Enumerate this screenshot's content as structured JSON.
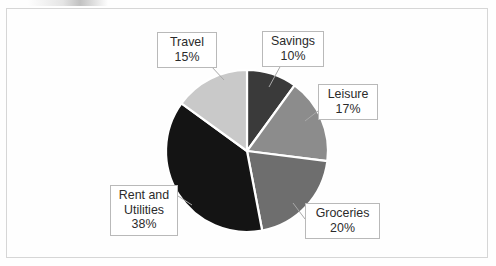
{
  "document": {
    "artifact_label": "scan-artifact"
  },
  "chart_data": {
    "type": "pie",
    "title": "",
    "subtitle": "",
    "xlabel": "",
    "ylabel": "",
    "legend_position": "none",
    "grid": false,
    "units": "percent",
    "label_format": "category + percentage",
    "start_angle_deg": -90,
    "direction": "clockwise",
    "categories": [
      "Savings",
      "Leisure",
      "Groceries",
      "Rent and Utilities",
      "Travel"
    ],
    "values": [
      10,
      17,
      20,
      38,
      15
    ],
    "total": 100,
    "slices": [
      {
        "name": "Savings",
        "label_line1": "Savings",
        "label_line2": "10%",
        "value": 10,
        "angle_deg": 36,
        "start_deg": -90,
        "end_deg": -54,
        "color": "#3a3a3a"
      },
      {
        "name": "Leisure",
        "label_line1": "Leisure",
        "label_line2": "17%",
        "value": 17,
        "angle_deg": 61.2,
        "start_deg": -54,
        "end_deg": 7.2,
        "color": "#8c8c8c"
      },
      {
        "name": "Groceries",
        "label_line1": "Groceries",
        "label_line2": "20%",
        "value": 20,
        "angle_deg": 72,
        "start_deg": 7.2,
        "end_deg": 79.2,
        "color": "#6e6e6e"
      },
      {
        "name": "Rent and Utilities",
        "label_line1": "Rent and",
        "label_line2": "Utilities",
        "label_line3": "38%",
        "value": 38,
        "angle_deg": 136.8,
        "start_deg": 79.2,
        "end_deg": 216,
        "color": "#141414"
      },
      {
        "name": "Travel",
        "label_line1": "Travel",
        "label_line2": "15%",
        "value": 15,
        "angle_deg": 54,
        "start_deg": 216,
        "end_deg": 270,
        "color": "#c9c9c9"
      }
    ],
    "colors": [
      "#3a3a3a",
      "#8c8c8c",
      "#6e6e6e",
      "#141414",
      "#c9c9c9"
    ],
    "slice_border_color": "#ffffff",
    "background_color": "#fefefe",
    "frame_border_color": "#d6d6d6",
    "callout_border_color": "#b9b9b9",
    "text_color": "#2b2b2b"
  }
}
